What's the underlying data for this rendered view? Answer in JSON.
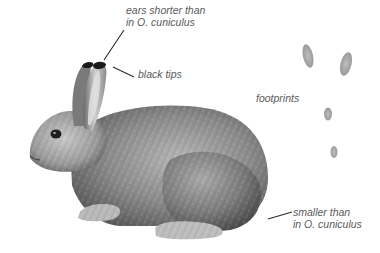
{
  "illustration": {
    "subject": "rabbit (side view)",
    "style": "graphite pencil field-guide drawing",
    "colors": {
      "background": "#ffffff",
      "fur_dark": "#3a3a3a",
      "fur_mid": "#7d7d7d",
      "fur_light": "#c4c4c4",
      "label_text": "#5a5a5a",
      "leader_line": "#2a2a2a"
    }
  },
  "annotations": {
    "ears": {
      "line1": "ears shorter than",
      "line2": "in O. cuniculus"
    },
    "tips": {
      "text": "black tips"
    },
    "footprints": {
      "text": "footprints"
    },
    "size": {
      "line1": "smaller than",
      "line2": "in O. cuniculus"
    }
  },
  "footprints": [
    {
      "cx": 308,
      "cy": 56,
      "rx": 5,
      "ry": 12
    },
    {
      "cx": 346,
      "cy": 64,
      "rx": 5.5,
      "ry": 12
    },
    {
      "cx": 328,
      "cy": 114,
      "rx": 4,
      "ry": 6.5
    },
    {
      "cx": 334,
      "cy": 152,
      "rx": 3.5,
      "ry": 6
    }
  ]
}
